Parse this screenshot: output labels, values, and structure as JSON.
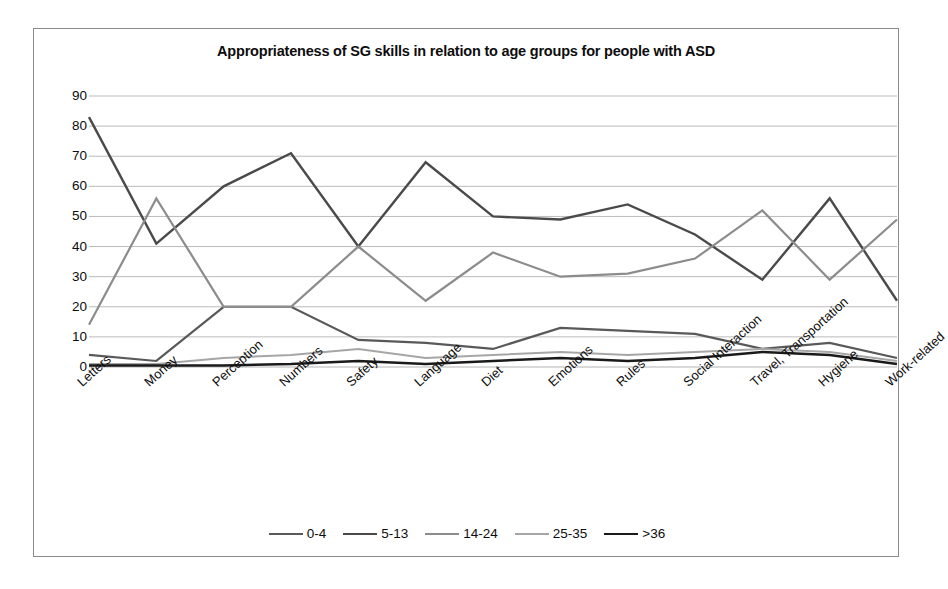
{
  "chart_data": {
    "type": "line",
    "title": "Appropriateness of SG skills in relation to age groups for people with ASD",
    "xlabel": "",
    "ylabel": "",
    "ylim": [
      0,
      90
    ],
    "yticks": [
      0,
      10,
      20,
      30,
      40,
      50,
      60,
      70,
      80,
      90
    ],
    "grid": true,
    "legend_position": "bottom",
    "categories": [
      "Letters",
      "Money",
      "Perception",
      "Numbers",
      "Safety",
      "Language",
      "Diet",
      "Emotions",
      "Rules",
      "Social Interaction",
      "Travel, Transportation",
      "Hygiene",
      "Work-related"
    ],
    "series": [
      {
        "name": "0-4",
        "color": "#595959",
        "width": 2.2,
        "values": [
          4,
          2,
          20,
          20,
          9,
          8,
          6,
          13,
          12,
          11,
          6,
          8,
          3
        ]
      },
      {
        "name": "5-13",
        "color": "#4a4a4a",
        "width": 2.4,
        "values": [
          83,
          41,
          60,
          71,
          40,
          68,
          50,
          49,
          54,
          44,
          29,
          56,
          22
        ]
      },
      {
        "name": "14-24",
        "color": "#8c8c8c",
        "width": 2.2,
        "values": [
          14,
          56,
          20,
          20,
          40,
          22,
          38,
          30,
          31,
          36,
          52,
          29,
          49
        ]
      },
      {
        "name": "25-35",
        "color": "#a6a6a6",
        "width": 2.0,
        "values": [
          1,
          1,
          3,
          4,
          6,
          3,
          4,
          5,
          4,
          5,
          6,
          5,
          2
        ]
      },
      {
        "name": ">36",
        "color": "#1a1a1a",
        "width": 2.4,
        "values": [
          0.5,
          0.5,
          0.5,
          1,
          2,
          1,
          2,
          3,
          2,
          3,
          5,
          4,
          1
        ]
      }
    ]
  },
  "figure": {
    "background": "#ffffff",
    "border_color": "#8a8a8a",
    "gridline_color": "#b3b3b3"
  }
}
